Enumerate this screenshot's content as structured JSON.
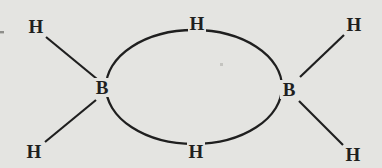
{
  "diagram": {
    "kind": "chemical-structure",
    "atoms": {
      "hydrogen_top_left": "H",
      "hydrogen_bottom_left": "H",
      "hydrogen_top_right": "H",
      "hydrogen_bottom_right": "H",
      "hydrogen_bridge_top": "H",
      "hydrogen_bridge_bottom": "H",
      "boron_left": "B",
      "boron_right": "B"
    },
    "colors": {
      "ink": "#1f1f1f",
      "paper": "#e4e4e1",
      "edge_artifact": "#8e8e8a",
      "speck": "#c4c4c0"
    }
  }
}
